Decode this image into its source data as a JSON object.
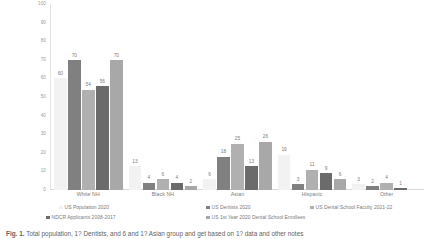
{
  "chart_data": {
    "type": "bar",
    "title": "",
    "xlabel": "",
    "ylabel": "",
    "ylim": [
      0,
      100
    ],
    "yticks": [
      100,
      90,
      80,
      70,
      60,
      50,
      40,
      30,
      20,
      10,
      0
    ],
    "grid": false,
    "legend_position": "bottom",
    "categories": [
      "White NH",
      "Black NH",
      "Asian",
      "Hispanic",
      "Other"
    ],
    "series": [
      {
        "name": "US Population 2020",
        "color": "#f2f2f2",
        "values": [
          60,
          13,
          6,
          19,
          3
        ]
      },
      {
        "name": "US Dentists 2020",
        "color": "#808080",
        "values": [
          70,
          4,
          18,
          3,
          2
        ]
      },
      {
        "name": "US Dental School Faculty 2021-22",
        "color": "#b0b0b0",
        "values": [
          54,
          6,
          25,
          11,
          4
        ]
      },
      {
        "name": "NDCR Applicants 2008-2017",
        "color": "#6b6b6b",
        "values": [
          56,
          4,
          13,
          9,
          1
        ]
      },
      {
        "name": "US 1st Year 2020 Dental School Enrollees",
        "color": "#a8a8a8",
        "values": [
          70,
          2,
          26,
          6,
          null
        ]
      }
    ]
  },
  "caption": {
    "figure_label": "Fig. 1.",
    "text": "Total population, 1? Dentists, and 6 and 1? Asian group and get based on 1? data and other notes"
  }
}
